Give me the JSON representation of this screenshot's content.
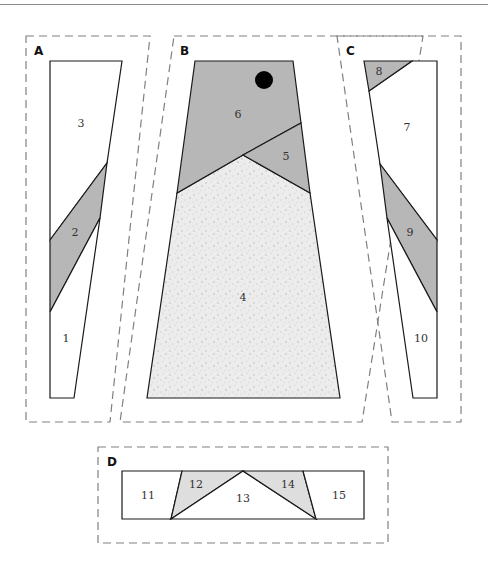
{
  "diagram": {
    "type": "foundation-paper-piecing-pattern",
    "colors": {
      "dark_fabric": "#b7b7b7",
      "light_fabric": "#dedede",
      "speckled_fabric": "#e6e6e6",
      "background": "#ffffff",
      "outline": "#1a1a1a",
      "seam_allowance": "#808080",
      "dot": "#000000"
    },
    "sections": [
      {
        "label": "A",
        "pieces": [
          "1",
          "2",
          "3"
        ]
      },
      {
        "label": "B",
        "pieces": [
          "4",
          "5",
          "6"
        ]
      },
      {
        "label": "C",
        "pieces": [
          "7",
          "8",
          "9",
          "10"
        ]
      },
      {
        "label": "D",
        "pieces": [
          "11",
          "12",
          "13",
          "14",
          "15"
        ]
      }
    ],
    "labels": {
      "A": "A",
      "B": "B",
      "C": "C",
      "D": "D",
      "p1": "1",
      "p2": "2",
      "p3": "3",
      "p4": "4",
      "p5": "5",
      "p6": "6",
      "p7": "7",
      "p8": "8",
      "p9": "9",
      "p10": "10",
      "p11": "11",
      "p12": "12",
      "p13": "13",
      "p14": "14",
      "p15": "15"
    }
  }
}
